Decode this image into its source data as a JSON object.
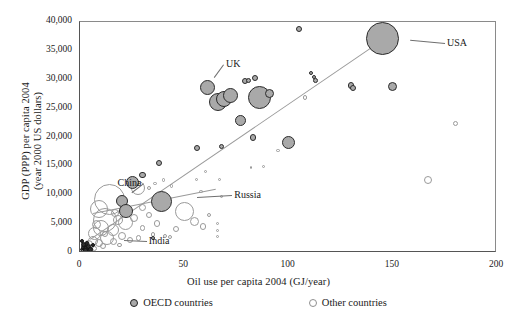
{
  "chart_data": {
    "type": "scatter",
    "title": "",
    "xlabel": "Oil use per  capita 2004 (GJ/year)",
    "ylabel": "GDP (PPP) per capita 2004\n(year 2000 US dollars)",
    "xlim": [
      0,
      200
    ],
    "ylim": [
      0,
      40000
    ],
    "xticks": [
      "0",
      "50",
      "100",
      "150",
      "200"
    ],
    "xtick_values": [
      0,
      50,
      100,
      150,
      200
    ],
    "yticks": [
      "0",
      "5,000",
      "10,000",
      "15,000",
      "20,000",
      "25,000",
      "30,000",
      "35,000",
      "40,000"
    ],
    "ytick_values": [
      0,
      5000,
      10000,
      15000,
      20000,
      25000,
      30000,
      35000,
      40000
    ],
    "grid": false,
    "legend_position": "bottom",
    "bubble_note": "Marker area is proportional to country population",
    "legend": [
      {
        "key": "oecd",
        "label": "OECD countries",
        "marker": "filled-grey-circle",
        "color": "#a9a9a9"
      },
      {
        "key": "other",
        "label": "Other countries",
        "marker": "open-circle",
        "color": "#ffffff"
      }
    ],
    "annotations": [
      {
        "text": "USA",
        "x": 176,
        "y": 36200,
        "point_x": 145,
        "point_y": 37200
      },
      {
        "text": "UK",
        "x": 70,
        "y": 32600,
        "point_x": 61,
        "point_y": 28600
      },
      {
        "text": "China",
        "x": 18,
        "y": 11900,
        "point_x": 20,
        "point_y": 9000
      },
      {
        "text": "India",
        "x": 33,
        "y": 1900,
        "point_x": 12,
        "point_y": 2200
      },
      {
        "text": "Russia",
        "x": 74,
        "y": 9900,
        "point_x": 43,
        "point_y": 9300
      }
    ],
    "trendlines": [
      {
        "name": "main-trend",
        "x0": 5,
        "y0": 2400,
        "x1": 152,
        "y1": 38600,
        "color": "#9a9a9a"
      },
      {
        "name": "secondary-trend",
        "x0": 6,
        "y0": 6900,
        "x1": 65,
        "y1": 11100,
        "color": "#9a9a9a"
      }
    ],
    "series": [
      {
        "name": "OECD countries",
        "marker": "filled",
        "points": [
          {
            "x": 145,
            "y": 37200,
            "r": 16.5,
            "label": "USA"
          },
          {
            "x": 61,
            "y": 28600,
            "r": 7.5,
            "label": "UK"
          },
          {
            "x": 66,
            "y": 26100,
            "r": 9.0,
            "label": ""
          },
          {
            "x": 69,
            "y": 26600,
            "r": 8.0,
            "label": ""
          },
          {
            "x": 72,
            "y": 27200,
            "r": 7.5,
            "label": ""
          },
          {
            "x": 86,
            "y": 27000,
            "r": 11.5,
            "label": ""
          },
          {
            "x": 91,
            "y": 27600,
            "r": 4.5,
            "label": ""
          },
          {
            "x": 79,
            "y": 29700,
            "r": 3.0,
            "label": ""
          },
          {
            "x": 81,
            "y": 29900,
            "r": 2.5,
            "label": ""
          },
          {
            "x": 84,
            "y": 30300,
            "r": 3.2,
            "label": ""
          },
          {
            "x": 77,
            "y": 23000,
            "r": 5.5,
            "label": ""
          },
          {
            "x": 83,
            "y": 20000,
            "r": 3.3,
            "label": ""
          },
          {
            "x": 100,
            "y": 19200,
            "r": 6.5,
            "label": ""
          },
          {
            "x": 130,
            "y": 29000,
            "r": 3.2,
            "label": ""
          },
          {
            "x": 131,
            "y": 28600,
            "r": 3.0,
            "label": ""
          },
          {
            "x": 150,
            "y": 28800,
            "r": 4.5,
            "label": ""
          },
          {
            "x": 111,
            "y": 31200,
            "r": 2.0,
            "label": ""
          },
          {
            "x": 113,
            "y": 29900,
            "r": 2.4,
            "label": ""
          },
          {
            "x": 112,
            "y": 30500,
            "r": 2.0,
            "label": ""
          },
          {
            "x": 105,
            "y": 38800,
            "r": 3.0,
            "label": ""
          },
          {
            "x": 56,
            "y": 18200,
            "r": 3.0,
            "label": ""
          },
          {
            "x": 38,
            "y": 15600,
            "r": 3.2,
            "label": ""
          },
          {
            "x": 30,
            "y": 13500,
            "r": 3.2,
            "label": ""
          },
          {
            "x": 25,
            "y": 12200,
            "r": 6.5,
            "label": ""
          },
          {
            "x": 20,
            "y": 9000,
            "r": 6.0,
            "label": ""
          },
          {
            "x": 22,
            "y": 7200,
            "r": 7.0,
            "label": "China"
          },
          {
            "x": 39,
            "y": 8900,
            "r": 10.5,
            "label": ""
          },
          {
            "x": 68,
            "y": 18400,
            "r": 2.6,
            "label": ""
          },
          {
            "x": 35,
            "y": 2600,
            "r": 2.2,
            "label": ""
          }
        ]
      },
      {
        "name": "Other countries",
        "marker": "open",
        "points": [
          {
            "x": 167,
            "y": 12700,
            "r": 4.0
          },
          {
            "x": 180,
            "y": 22400,
            "r": 2.6
          },
          {
            "x": 108,
            "y": 26900,
            "r": 2.2
          },
          {
            "x": 95,
            "y": 17800,
            "r": 1.6
          },
          {
            "x": 88,
            "y": 15000,
            "r": 1.6
          },
          {
            "x": 82,
            "y": 14800,
            "r": 1.4
          },
          {
            "x": 60,
            "y": 14100,
            "r": 1.6
          },
          {
            "x": 67,
            "y": 12700,
            "r": 1.5
          },
          {
            "x": 56,
            "y": 12800,
            "r": 1.5
          },
          {
            "x": 58,
            "y": 10600,
            "r": 1.6
          },
          {
            "x": 68,
            "y": 9800,
            "r": 1.6
          },
          {
            "x": 50,
            "y": 7200,
            "r": 9.5
          },
          {
            "x": 55,
            "y": 5500,
            "r": 4.5
          },
          {
            "x": 59,
            "y": 4600,
            "r": 3.4
          },
          {
            "x": 62,
            "y": 6500,
            "r": 2.0
          },
          {
            "x": 66,
            "y": 5100,
            "r": 1.7
          },
          {
            "x": 66,
            "y": 3900,
            "r": 1.7
          },
          {
            "x": 66,
            "y": 2900,
            "r": 1.7
          },
          {
            "x": 44,
            "y": 11600,
            "r": 1.7
          },
          {
            "x": 40,
            "y": 12600,
            "r": 1.8
          },
          {
            "x": 36,
            "y": 12100,
            "r": 1.6
          },
          {
            "x": 33,
            "y": 11200,
            "r": 2.0
          },
          {
            "x": 28,
            "y": 11300,
            "r": 7.0
          },
          {
            "x": 30,
            "y": 7900,
            "r": 3.5
          },
          {
            "x": 33,
            "y": 6600,
            "r": 3.2
          },
          {
            "x": 37,
            "y": 5100,
            "r": 3.2
          },
          {
            "x": 30,
            "y": 4300,
            "r": 2.8
          },
          {
            "x": 35,
            "y": 3200,
            "r": 2.4
          },
          {
            "x": 26,
            "y": 6100,
            "r": 4.0
          },
          {
            "x": 22,
            "y": 5200,
            "r": 7.5
          },
          {
            "x": 14,
            "y": 9200,
            "r": 15.5
          },
          {
            "x": 12,
            "y": 5800,
            "r": 12.0
          },
          {
            "x": 9,
            "y": 7600,
            "r": 9.0
          },
          {
            "x": 10,
            "y": 4300,
            "r": 8.0
          },
          {
            "x": 16,
            "y": 4000,
            "r": 6.0
          },
          {
            "x": 18,
            "y": 5800,
            "r": 5.0
          },
          {
            "x": 7,
            "y": 3400,
            "r": 6.5
          },
          {
            "x": 13,
            "y": 2600,
            "r": 7.0
          },
          {
            "x": 6,
            "y": 2100,
            "r": 5.0
          },
          {
            "x": 9,
            "y": 1700,
            "r": 4.0
          },
          {
            "x": 4,
            "y": 1500,
            "r": 4.5
          },
          {
            "x": 3,
            "y": 1100,
            "r": 3.5
          },
          {
            "x": 5,
            "y": 900,
            "r": 3.0
          },
          {
            "x": 2,
            "y": 700,
            "r": 2.5
          },
          {
            "x": 7,
            "y": 800,
            "r": 2.5
          },
          {
            "x": 11,
            "y": 1200,
            "r": 3.0
          },
          {
            "x": 16,
            "y": 2000,
            "r": 3.5
          },
          {
            "x": 20,
            "y": 3000,
            "r": 4.0
          },
          {
            "x": 24,
            "y": 2200,
            "r": 3.0
          },
          {
            "x": 28,
            "y": 2600,
            "r": 2.6
          },
          {
            "x": 19,
            "y": 1400,
            "r": 2.4
          },
          {
            "x": 12,
            "y": 3300,
            "r": 3.0
          },
          {
            "x": 8,
            "y": 5000,
            "r": 4.5
          },
          {
            "x": 17,
            "y": 7000,
            "r": 4.0
          },
          {
            "x": 21,
            "y": 8600,
            "r": 3.0
          },
          {
            "x": 46,
            "y": 4200,
            "r": 3.0
          },
          {
            "x": 43,
            "y": 2700,
            "r": 2.0
          },
          {
            "x": 41,
            "y": 3000,
            "r": 2.0
          }
        ]
      },
      {
        "name": "Dark dense cluster",
        "marker": "dark",
        "points": [
          {
            "x": 2.0,
            "y": 1000,
            "r": 3.5
          },
          {
            "x": 3.0,
            "y": 700,
            "r": 3.0
          },
          {
            "x": 1.5,
            "y": 1500,
            "r": 2.6
          },
          {
            "x": 4.0,
            "y": 1100,
            "r": 2.6
          },
          {
            "x": 2.5,
            "y": 400,
            "r": 2.4
          },
          {
            "x": 5.0,
            "y": 600,
            "r": 2.2
          },
          {
            "x": 1.0,
            "y": 2000,
            "r": 2.0
          },
          {
            "x": 3.5,
            "y": 1800,
            "r": 2.0
          },
          {
            "x": 6.0,
            "y": 1300,
            "r": 2.0
          },
          {
            "x": 0.8,
            "y": 600,
            "r": 1.8
          }
        ]
      }
    ]
  }
}
